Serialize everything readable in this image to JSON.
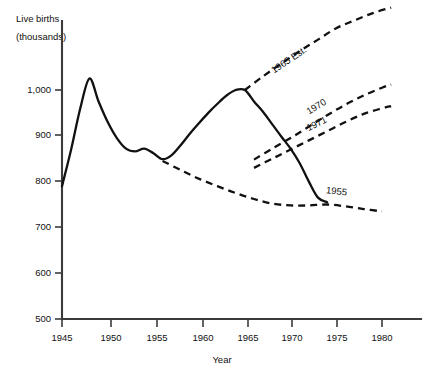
{
  "chart_data": {
    "type": "line",
    "title": "",
    "xlabel": "Year",
    "ylabel": "Live births (thousands)",
    "ylabel_line1": "Live births",
    "ylabel_line2": "(thousands)",
    "xlim": [
      1945,
      1982
    ],
    "ylim": [
      500,
      1100
    ],
    "grid": false,
    "legend": "inline-annotations",
    "xticks": [
      "1945",
      "1950",
      "1955",
      "1960",
      "1965",
      "1970",
      "1975",
      "1980"
    ],
    "xtick_values": [
      1945,
      1950,
      1955,
      1960,
      1965,
      1970,
      1975,
      1980
    ],
    "yticks": [
      "500",
      "600",
      "700",
      "800",
      "900",
      "1,000"
    ],
    "ytick_values": [
      500,
      600,
      700,
      800,
      900,
      1000
    ],
    "series": [
      {
        "name": "Actual live births",
        "style": "solid",
        "label": "",
        "x": [
          1945,
          1946,
          1947,
          1948,
          1949,
          1950,
          1951,
          1952,
          1953,
          1954,
          1955,
          1956,
          1957,
          1958,
          1959,
          1960,
          1961,
          1962,
          1963,
          1964,
          1965,
          1966,
          1967,
          1968,
          1969,
          1970,
          1971,
          1972,
          1973,
          1974
        ],
        "values": [
          790,
          870,
          960,
          1025,
          975,
          930,
          895,
          872,
          866,
          872,
          862,
          849,
          858,
          880,
          905,
          928,
          950,
          970,
          988,
          1000,
          1000,
          975,
          952,
          925,
          898,
          872,
          840,
          800,
          765,
          755
        ]
      },
      {
        "name": "1955 Est.",
        "style": "dashed",
        "label": "1955",
        "label_x": 1975,
        "label_y": 772,
        "x": [
          1956,
          1958,
          1960,
          1962,
          1964,
          1966,
          1968,
          1970,
          1972,
          1974,
          1976,
          1978,
          1980
        ],
        "values": [
          845,
          825,
          806,
          790,
          775,
          762,
          752,
          748,
          748,
          750,
          746,
          740,
          735
        ]
      },
      {
        "name": "1965 Est.",
        "style": "dashed",
        "label": "1965 Est.",
        "label_x": 1970,
        "label_y": 1060,
        "x": [
          1965,
          1967,
          1969,
          1971,
          1973,
          1975,
          1977,
          1979,
          1981
        ],
        "values": [
          1000,
          1030,
          1058,
          1085,
          1110,
          1135,
          1152,
          1168,
          1180
        ]
      },
      {
        "name": "1970 Est.",
        "style": "dashed",
        "label": "1970",
        "label_x": 1973,
        "label_y": 958,
        "x": [
          1966,
          1968,
          1970,
          1972,
          1974,
          1976,
          1978,
          1980,
          1981
        ],
        "values": [
          848,
          872,
          895,
          920,
          945,
          968,
          988,
          1005,
          1012
        ]
      },
      {
        "name": "1971 Est.",
        "style": "dashed",
        "label": "1971",
        "label_x": 1973,
        "label_y": 920,
        "x": [
          1966,
          1968,
          1970,
          1972,
          1974,
          1976,
          1978,
          1980,
          1981
        ],
        "values": [
          830,
          850,
          870,
          890,
          910,
          930,
          948,
          960,
          965
        ]
      }
    ],
    "colors": {
      "line": "#111111",
      "axis": "#3b3b3b",
      "background": "#ffffff"
    }
  }
}
